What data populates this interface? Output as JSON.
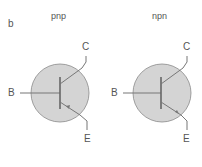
{
  "panel_label": "b",
  "transistors": [
    {
      "type_label": "pnp",
      "base": "B",
      "collector": "C",
      "emitter": "E"
    },
    {
      "type_label": "npn",
      "base": "B",
      "collector": "C",
      "emitter": "E"
    }
  ],
  "colors": {
    "fill": "#d4d4d4",
    "stroke": "#777777",
    "text": "#555555"
  }
}
